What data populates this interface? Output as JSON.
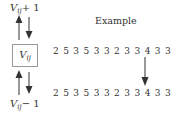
{
  "diagram": {
    "left": {
      "top_label": {
        "var": "V",
        "sub": "ij",
        "op": "+ 1"
      },
      "center_label": {
        "var": "V",
        "sub": "ij"
      },
      "bottom_label": {
        "var": "V",
        "sub": "ij",
        "op": "− 1"
      },
      "arrows": [
        "up-arrow-filled",
        "down-arrow-filled",
        "up-arrow-filled",
        "down-arrow-filled"
      ]
    },
    "right": {
      "title": "Example",
      "sequence_before": "2 5 3 5 3 3 2 3 3 4 3 3 4 2 7",
      "sequence_after": "2 5 3 5 3 3 2 3 3 4 3 3 3 2 7",
      "changed_position": 13,
      "changed_from": "4",
      "changed_to": "3"
    },
    "colors": {
      "stroke": "#333333",
      "box_border": "#999999",
      "background": "#ffffff"
    }
  }
}
